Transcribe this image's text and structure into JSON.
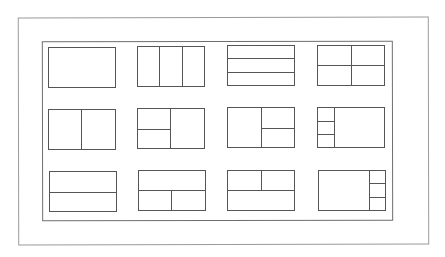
{
  "diagram": {
    "title": "",
    "colors": {
      "line": "#555555",
      "outer_frame": "#9a9a9a",
      "inner_frame": "#6e6e6e",
      "background": "#ffffff"
    },
    "grid": {
      "columns": 4,
      "rows": 3
    },
    "layouts": [
      {
        "id": "single",
        "label": "Single pane",
        "row": 0,
        "col": 0
      },
      {
        "id": "three-columns",
        "label": "Three vertical columns",
        "row": 0,
        "col": 1
      },
      {
        "id": "three-rows",
        "label": "Three horizontal rows",
        "row": 0,
        "col": 2
      },
      {
        "id": "grid-2x2",
        "label": "Four panes (2x2)",
        "row": 0,
        "col": 3
      },
      {
        "id": "two-columns",
        "label": "Two vertical columns",
        "row": 1,
        "col": 0
      },
      {
        "id": "left-split-two",
        "label": "Left split in two, right single",
        "row": 1,
        "col": 1
      },
      {
        "id": "right-split-two",
        "label": "Left single, right split in two",
        "row": 1,
        "col": 2
      },
      {
        "id": "left-narrow-three",
        "label": "Narrow left column of three, large right",
        "row": 1,
        "col": 3
      },
      {
        "id": "two-rows",
        "label": "Two horizontal rows",
        "row": 2,
        "col": 0
      },
      {
        "id": "bottom-split-two",
        "label": "Top single, bottom split in two",
        "row": 2,
        "col": 1
      },
      {
        "id": "top-split-two",
        "label": "Top split in two, bottom single",
        "row": 2,
        "col": 2
      },
      {
        "id": "right-narrow-three",
        "label": "Large left, narrow right column of three",
        "row": 2,
        "col": 3
      }
    ]
  }
}
